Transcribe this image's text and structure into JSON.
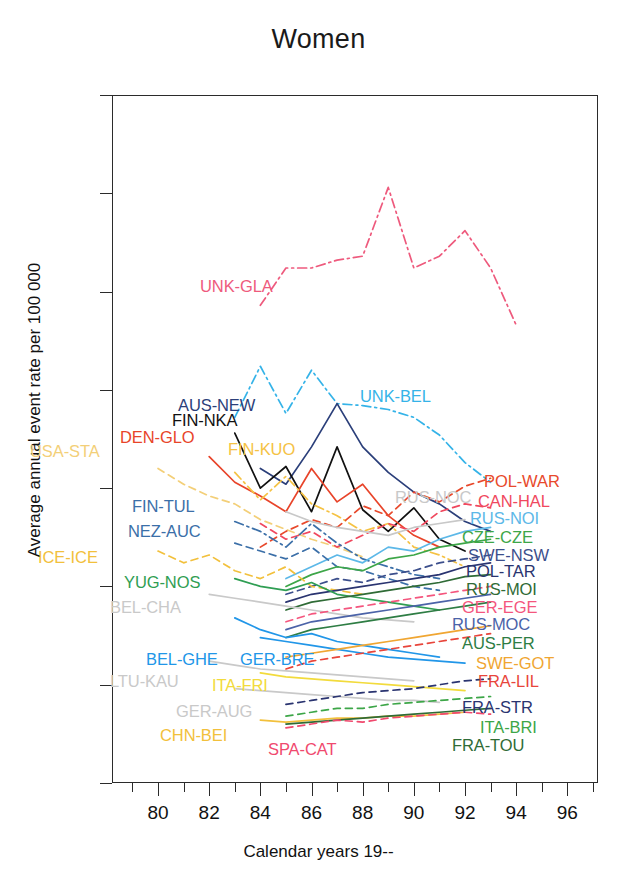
{
  "chart_data": {
    "type": "line",
    "title": "Women",
    "xlabel": "Calendar years 19--",
    "ylabel": "Average annual event rate per 100 000",
    "xlim": [
      78.2,
      97.2
    ],
    "ylim": [
      0,
      350
    ],
    "grid": false,
    "legend": "inline-labels",
    "xticks_major": [
      "80",
      "82",
      "84",
      "86",
      "88",
      "90",
      "92",
      "94",
      "96"
    ],
    "xticks_major_values": [
      80,
      82,
      84,
      86,
      88,
      90,
      92,
      94,
      96
    ],
    "xticks_minor_values": [
      79,
      81,
      83,
      85,
      87,
      89,
      91,
      93,
      95,
      96,
      97
    ],
    "yticks": [
      "0",
      "50",
      "100",
      "150",
      "200",
      "250",
      "300",
      "350"
    ],
    "yticks_values": [
      0,
      50,
      100,
      150,
      200,
      250,
      300,
      350
    ],
    "series": [
      {
        "name": "UNK-GLA",
        "color": "#EE5A7D",
        "dash": "dashdot",
        "label_x": 200,
        "label_y": 277,
        "x": [
          84,
          85,
          86,
          87,
          88,
          89,
          90,
          91,
          92,
          93,
          94
        ],
        "values": [
          243,
          262,
          262,
          266,
          268,
          303,
          262,
          268,
          281,
          262,
          233
        ]
      },
      {
        "name": "UNK-BEL",
        "color": "#35B3E8",
        "dash": "dashdot",
        "label_x": 360,
        "label_y": 387,
        "x": [
          83,
          84,
          85,
          86,
          87,
          88,
          89,
          90,
          91,
          92,
          93
        ],
        "values": [
          186,
          212,
          188,
          210,
          193,
          192,
          190,
          186,
          177,
          163,
          153
        ]
      },
      {
        "name": "AUS-NEW",
        "color": "#2B3F7A",
        "dash": "solid",
        "label_x": 178,
        "label_y": 396,
        "x": [
          84,
          85,
          86,
          87,
          88,
          89,
          90,
          91,
          92,
          93
        ],
        "values": [
          160,
          152,
          171,
          193,
          171,
          158,
          148,
          142,
          133,
          128
        ]
      },
      {
        "name": "FIN-NKA",
        "color": "#111111",
        "dash": "solid",
        "label_x": 172,
        "label_y": 411,
        "x": [
          83,
          84,
          85,
          86,
          87,
          88,
          89,
          90,
          91,
          92
        ],
        "values": [
          178,
          150,
          161,
          138,
          171,
          139,
          128,
          140,
          124,
          118
        ]
      },
      {
        "name": "DEN-GLO",
        "color": "#E8442A",
        "dash": "solid",
        "label_x": 120,
        "label_y": 428,
        "x": [
          82,
          83,
          84,
          85,
          86,
          87,
          88,
          89,
          90,
          91
        ],
        "values": [
          166,
          153,
          146,
          138,
          160,
          143,
          152,
          136,
          126,
          120
        ]
      },
      {
        "name": "FIN-KUO",
        "color": "#F5C244",
        "dash": "dashdot",
        "label_x": 228,
        "label_y": 440,
        "x": [
          83,
          84,
          85,
          86,
          87,
          88,
          89,
          90,
          91,
          92
        ],
        "values": [
          158,
          144,
          156,
          142,
          136,
          128,
          132,
          120,
          116,
          110
        ]
      },
      {
        "name": "USA-STA",
        "color": "#F3CF78",
        "dash": "dashed",
        "label_x": 30,
        "label_y": 442,
        "x": [
          80,
          81,
          82,
          83,
          84,
          85,
          86,
          87,
          88
        ],
        "values": [
          160,
          152,
          146,
          142,
          134,
          129,
          124,
          120,
          115
        ]
      },
      {
        "name": "POL-WAR",
        "color": "#E8492C",
        "dash": "dashed",
        "label_x": 484,
        "label_y": 472,
        "x": [
          84,
          85,
          86,
          87,
          88,
          89,
          90,
          91,
          92,
          93
        ],
        "values": [
          120,
          128,
          134,
          130,
          141,
          136,
          148,
          143,
          151,
          155
        ]
      },
      {
        "name": "CAN-HAL",
        "color": "#F0485E",
        "dash": "dashed",
        "label_x": 478,
        "label_y": 492,
        "x": [
          84,
          85,
          86,
          87,
          88,
          89,
          90,
          91,
          92,
          93
        ],
        "values": [
          132,
          124,
          128,
          120,
          126,
          132,
          128,
          138,
          142,
          140
        ]
      },
      {
        "name": "RUS-NOC",
        "color": "#C8C8C8",
        "dash": "solid",
        "label_x": 395,
        "label_y": 488,
        "x": [
          85,
          86,
          87,
          88,
          89,
          90,
          91,
          92
        ],
        "values": [
          138,
          133,
          130,
          128,
          126,
          130,
          132,
          134
        ]
      },
      {
        "name": "FIN-TUL",
        "color": "#3B6FA8",
        "dash": "dashdot",
        "label_x": 132,
        "label_y": 497,
        "x": [
          83,
          84,
          85,
          86,
          87,
          88,
          89,
          90,
          91
        ],
        "values": [
          133,
          128,
          120,
          132,
          122,
          114,
          110,
          106,
          104
        ]
      },
      {
        "name": "RUS-NOI",
        "color": "#5CB8E8",
        "dash": "solid",
        "label_x": 470,
        "label_y": 509,
        "x": [
          85,
          86,
          87,
          88,
          89,
          90,
          91,
          92,
          93
        ],
        "values": [
          104,
          110,
          116,
          112,
          120,
          118,
          124,
          128,
          130
        ]
      },
      {
        "name": "NEZ-AUC",
        "color": "#3B6FA8",
        "dash": "dashed",
        "label_x": 128,
        "label_y": 522,
        "x": [
          83,
          84,
          85,
          86,
          87,
          88,
          89,
          90,
          91
        ],
        "values": [
          122,
          118,
          114,
          120,
          110,
          108,
          104,
          100,
          98
        ]
      },
      {
        "name": "CZE-CZE",
        "color": "#3DA648",
        "dash": "solid",
        "label_x": 462,
        "label_y": 528,
        "x": [
          85,
          86,
          87,
          88,
          89,
          90,
          91,
          92,
          93
        ],
        "values": [
          100,
          106,
          110,
          108,
          114,
          116,
          120,
          122,
          124
        ]
      },
      {
        "name": "SWE-NSW",
        "color": "#3C4F8C",
        "dash": "dashed",
        "label_x": 468,
        "label_y": 546,
        "x": [
          85,
          86,
          87,
          88,
          89,
          90,
          91,
          92,
          93
        ],
        "values": [
          96,
          100,
          104,
          102,
          106,
          108,
          112,
          114,
          116
        ]
      },
      {
        "name": "ICE-ICE",
        "color": "#F2C03C",
        "dash": "dashed",
        "label_x": 38,
        "label_y": 548,
        "x": [
          80,
          81,
          82,
          83,
          84,
          85,
          86,
          87,
          88
        ],
        "values": [
          118,
          112,
          116,
          108,
          104,
          110,
          100,
          98,
          96
        ]
      },
      {
        "name": "POL-TAR",
        "color": "#2A3470",
        "dash": "solid",
        "label_x": 466,
        "label_y": 562,
        "x": [
          85,
          86,
          87,
          88,
          89,
          90,
          91,
          92,
          93
        ],
        "values": [
          92,
          96,
          98,
          100,
          102,
          104,
          106,
          110,
          112
        ]
      },
      {
        "name": "YUG-NOS",
        "color": "#2F9E53",
        "dash": "solid",
        "label_x": 124,
        "label_y": 573,
        "x": [
          83,
          84,
          85,
          86,
          87,
          88,
          89,
          90,
          91
        ],
        "values": [
          104,
          100,
          98,
          102,
          96,
          94,
          92,
          90,
          88
        ]
      },
      {
        "name": "RUS-MOI",
        "color": "#2F6B36",
        "dash": "solid",
        "label_x": 466,
        "label_y": 580,
        "x": [
          85,
          86,
          87,
          88,
          89,
          90,
          91,
          92,
          93
        ],
        "values": [
          88,
          92,
          94,
          96,
          98,
          100,
          102,
          105,
          106
        ]
      },
      {
        "name": "BEL-CHA",
        "color": "#C9C9C9",
        "dash": "solid",
        "label_x": 110,
        "label_y": 598,
        "x": [
          82,
          83,
          84,
          85,
          86,
          87,
          88,
          89,
          90
        ],
        "values": [
          96,
          94,
          92,
          90,
          88,
          86,
          84,
          83,
          82
        ]
      },
      {
        "name": "GER-EGE",
        "color": "#F4567E",
        "dash": "dashed",
        "label_x": 462,
        "label_y": 598,
        "x": [
          85,
          86,
          87,
          88,
          89,
          90,
          91,
          92,
          93
        ],
        "values": [
          82,
          86,
          88,
          90,
          92,
          94,
          96,
          98,
          100
        ]
      },
      {
        "name": "RUS-MOC",
        "color": "#4B63A8",
        "dash": "solid",
        "label_x": 452,
        "label_y": 615,
        "x": [
          85,
          86,
          87,
          88,
          89,
          90,
          91,
          92,
          93
        ],
        "values": [
          78,
          82,
          84,
          86,
          88,
          90,
          92,
          94,
          96
        ]
      },
      {
        "name": "AUS-PER",
        "color": "#2E7D44",
        "dash": "solid",
        "label_x": 462,
        "label_y": 634,
        "x": [
          85,
          86,
          87,
          88,
          89,
          90,
          91,
          92,
          93
        ],
        "values": [
          74,
          78,
          80,
          82,
          84,
          86,
          88,
          90,
          92
        ]
      },
      {
        "name": "BEL-GHE",
        "color": "#2196E8",
        "dash": "solid",
        "label_x": 146,
        "label_y": 650,
        "x": [
          83,
          84,
          85,
          86,
          87,
          88,
          89,
          90,
          91
        ],
        "values": [
          84,
          78,
          74,
          76,
          72,
          70,
          68,
          66,
          64
        ]
      },
      {
        "name": "GER-BRE",
        "color": "#2196E8",
        "dash": "solid",
        "label_x": 240,
        "label_y": 650,
        "x": [
          84,
          85,
          86,
          87,
          88,
          89,
          90,
          91,
          92
        ],
        "values": [
          74,
          72,
          70,
          68,
          66,
          64,
          63,
          62,
          61
        ]
      },
      {
        "name": "SWE-GOT",
        "color": "#F0A632",
        "dash": "solid",
        "label_x": 476,
        "label_y": 654,
        "x": [
          85,
          86,
          87,
          88,
          89,
          90,
          91,
          92,
          93
        ],
        "values": [
          64,
          66,
          68,
          70,
          72,
          74,
          76,
          78,
          80
        ]
      },
      {
        "name": "FRA-LIL",
        "color": "#E8453B",
        "dash": "dashed",
        "label_x": 478,
        "label_y": 672,
        "x": [
          85,
          86,
          87,
          88,
          89,
          90,
          91,
          92,
          93
        ],
        "values": [
          58,
          62,
          64,
          66,
          68,
          70,
          72,
          74,
          76
        ]
      },
      {
        "name": "LTU-KAU",
        "color": "#C9C9C9",
        "dash": "solid",
        "label_x": 110,
        "label_y": 672,
        "x": [
          82,
          83,
          84,
          85,
          86,
          87,
          88,
          89,
          90
        ],
        "values": [
          62,
          60,
          58,
          57,
          56,
          55,
          54,
          53,
          52
        ]
      },
      {
        "name": "ITA-FRI",
        "color": "#F2DB3C",
        "dash": "solid",
        "label_x": 212,
        "label_y": 676,
        "x": [
          84,
          85,
          86,
          87,
          88,
          89,
          90,
          91,
          92
        ],
        "values": [
          56,
          54,
          53,
          52,
          51,
          50,
          49,
          48,
          47
        ]
      },
      {
        "name": "GER-AUG",
        "color": "#C9C9C9",
        "dash": "solid",
        "label_x": 176,
        "label_y": 702,
        "x": [
          83,
          84,
          85,
          86,
          87,
          88,
          89,
          90,
          91
        ],
        "values": [
          48,
          47,
          46,
          45,
          44,
          43,
          42,
          42,
          41
        ]
      },
      {
        "name": "FRA-STR",
        "color": "#2A3470",
        "dash": "dashed",
        "label_x": 462,
        "label_y": 698,
        "x": [
          85,
          86,
          87,
          88,
          89,
          90,
          91,
          92,
          93
        ],
        "values": [
          40,
          42,
          44,
          46,
          47,
          48,
          50,
          52,
          53
        ]
      },
      {
        "name": "ITA-BRI",
        "color": "#3DA648",
        "dash": "dashed",
        "label_x": 480,
        "label_y": 718,
        "x": [
          85,
          86,
          87,
          88,
          89,
          90,
          91,
          92,
          93
        ],
        "values": [
          34,
          36,
          38,
          38,
          40,
          41,
          42,
          43,
          44
        ]
      },
      {
        "name": "CHN-BEI",
        "color": "#F2C03C",
        "dash": "solid",
        "label_x": 160,
        "label_y": 726,
        "x": [
          84,
          85,
          86,
          87,
          88,
          89,
          90,
          91,
          92
        ],
        "values": [
          32,
          31,
          32,
          33,
          33,
          34,
          34,
          35,
          36
        ]
      },
      {
        "name": "FRA-TOU",
        "color": "#2F6B36",
        "dash": "solid",
        "label_x": 452,
        "label_y": 736,
        "x": [
          85,
          86,
          87,
          88,
          89,
          90,
          91,
          92,
          93
        ],
        "values": [
          30,
          31,
          32,
          33,
          34,
          35,
          36,
          37,
          38
        ]
      },
      {
        "name": "SPA-CAT",
        "color": "#F0496E",
        "dash": "dashed",
        "label_x": 268,
        "label_y": 740,
        "x": [
          85,
          86,
          87,
          88,
          89,
          90,
          91,
          92,
          93
        ],
        "values": [
          28,
          30,
          32,
          31,
          33,
          34,
          35,
          36,
          35
        ]
      }
    ]
  }
}
